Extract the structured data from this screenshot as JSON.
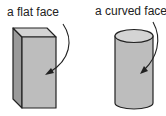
{
  "labels": {
    "flat": "a flat face",
    "curved": "a curved face"
  },
  "shapes": {
    "cuboid": "rectangular prism",
    "cylinder": "cylinder"
  },
  "colors": {
    "outline": "#222222",
    "front": "#bdbdbd",
    "side": "#9a9a9a",
    "top": "#d4d4d4"
  }
}
